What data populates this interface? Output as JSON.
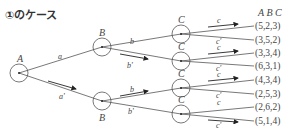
{
  "title": "①のケース",
  "header": "A B C",
  "nodes": {
    "A": "A",
    "B": "B",
    "C": "C"
  },
  "edges": {
    "a": "a",
    "a_prime": "a'",
    "b": "b",
    "b_prime": "b'",
    "c": "c",
    "c_prime": "c'"
  },
  "results": [
    "(5,2,3)",
    "(3,5,2)",
    "(3,3,4)",
    "(6,3,1)",
    "(4,3,4)",
    "(2,5,3)",
    "(2,6,2)",
    "(5,1,4)"
  ],
  "colors": {
    "line": "#555555",
    "text": "#444444"
  }
}
